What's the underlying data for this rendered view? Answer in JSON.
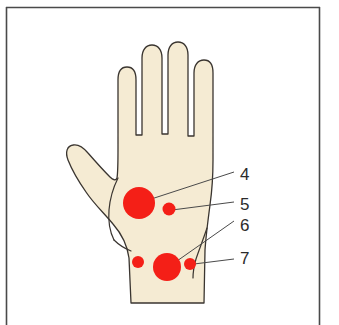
{
  "figure": {
    "background_color": "#ffffff",
    "frame": {
      "color": "#4a4a4a",
      "x": 6,
      "y": 7,
      "width": 314,
      "height": 318,
      "edges_visible": "top-left-right"
    },
    "hand": {
      "fill_color": "#f5ebd3",
      "outline_color": "#3a3530",
      "outline_width": 1.3
    },
    "markers": [
      {
        "id": "marker-4",
        "label": "4",
        "cx": 139,
        "cy": 203,
        "r": 16,
        "color": "#f41f17"
      },
      {
        "id": "marker-5",
        "label": "5",
        "cx": 169,
        "cy": 209,
        "r": 6.5,
        "color": "#f41f17"
      },
      {
        "id": "marker-6",
        "label": "6",
        "cx": 167,
        "cy": 267,
        "r": 14,
        "color": "#f41f17"
      },
      {
        "id": "marker-7",
        "label": "7",
        "cx": 190,
        "cy": 264,
        "r": 6,
        "color": "#f41f17"
      },
      {
        "id": "marker-unlabeled-left",
        "label": "",
        "cx": 138,
        "cy": 262,
        "r": 6,
        "color": "#f41f17"
      }
    ],
    "callouts": [
      {
        "id": "callout-4",
        "label": "4",
        "label_x": 240,
        "label_y": 180,
        "line_from_x": 139,
        "line_from_y": 203,
        "line_to_x": 234,
        "line_to_y": 172
      },
      {
        "id": "callout-5",
        "label": "5",
        "label_x": 240,
        "label_y": 210,
        "line_from_x": 172,
        "line_from_y": 210,
        "line_to_x": 234,
        "line_to_y": 202
      },
      {
        "id": "callout-6",
        "label": "6",
        "label_x": 240,
        "label_y": 231,
        "line_from_x": 167,
        "line_from_y": 268,
        "line_to_x": 234,
        "line_to_y": 221
      },
      {
        "id": "callout-7",
        "label": "7",
        "label_x": 240,
        "label_y": 264,
        "line_from_x": 194,
        "line_from_y": 264,
        "line_to_x": 234,
        "line_to_y": 259
      }
    ],
    "callout_line_color": "#4a4a4a",
    "callout_line_width": 1
  }
}
